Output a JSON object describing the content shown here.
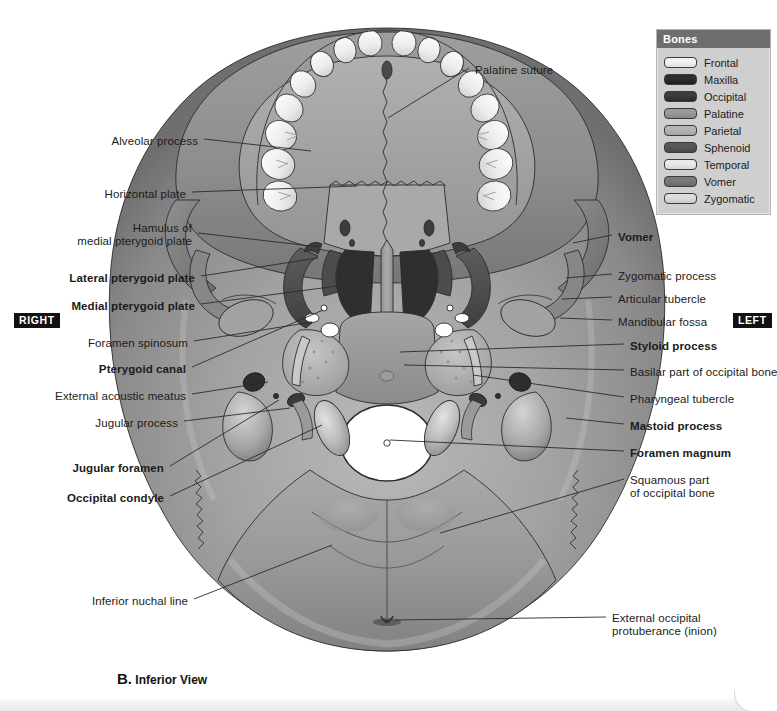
{
  "figure": {
    "caption_letter": "B.",
    "caption_text": "Inferior View"
  },
  "side_markers": {
    "right": "RIGHT",
    "left": "LEFT"
  },
  "legend": {
    "title": "Bones",
    "items": [
      {
        "label": "Frontal",
        "color": "#f2f2f2"
      },
      {
        "label": "Maxilla",
        "color": "#2e2e2e"
      },
      {
        "label": "Occipital",
        "color": "#3d3d3d"
      },
      {
        "label": "Palatine",
        "color": "#9a9a9a"
      },
      {
        "label": "Parietal",
        "color": "#b5b5b5"
      },
      {
        "label": "Sphenoid",
        "color": "#585858"
      },
      {
        "label": "Temporal",
        "color": "#eaeaea"
      },
      {
        "label": "Vomer",
        "color": "#7a7a7a"
      },
      {
        "label": "Zygomatic",
        "color": "#dcdcdc"
      }
    ]
  },
  "labels_left": [
    {
      "name": "alveolar-process",
      "text": "Alveolar process",
      "bold": false,
      "x": 198,
      "y": 135,
      "lx": 204,
      "ly": 139,
      "tx": 311,
      "ty": 151
    },
    {
      "name": "horizontal-plate",
      "text": "Horizontal plate",
      "bold": false,
      "x": 186,
      "y": 188,
      "lx": 192,
      "ly": 192,
      "tx": 357,
      "ty": 186
    },
    {
      "name": "hamulus-medial-pterygoid",
      "text": "Hamulus of\nmedial pterygoid plate",
      "bold": false,
      "x": 192,
      "y": 222,
      "lx": 198,
      "ly": 233,
      "tx": 320,
      "ty": 247
    },
    {
      "name": "lateral-pterygoid-plate",
      "text": "Lateral pterygoid plate",
      "bold": true,
      "x": 195,
      "y": 272,
      "lx": 201,
      "ly": 276,
      "tx": 318,
      "ty": 258
    },
    {
      "name": "medial-pterygoid-plate",
      "text": "Medial pterygoid plate",
      "bold": true,
      "x": 195,
      "y": 300,
      "lx": 201,
      "ly": 304,
      "tx": 345,
      "ty": 285
    },
    {
      "name": "foramen-spinosum",
      "text": "Foramen spinosum",
      "bold": false,
      "x": 188,
      "y": 337,
      "lx": 194,
      "ly": 341,
      "tx": 312,
      "ty": 322
    },
    {
      "name": "pterygoid-canal",
      "text": "Pterygoid canal",
      "bold": true,
      "x": 186,
      "y": 363,
      "lx": 192,
      "ly": 367,
      "tx": 323,
      "ty": 310
    },
    {
      "name": "external-acoustic-meatus",
      "text": "External acoustic meatus",
      "bold": false,
      "x": 186,
      "y": 390,
      "lx": 192,
      "ly": 394,
      "tx": 268,
      "ty": 382
    },
    {
      "name": "jugular-process",
      "text": "Jugular process",
      "bold": false,
      "x": 178,
      "y": 417,
      "lx": 184,
      "ly": 421,
      "tx": 290,
      "ty": 408
    },
    {
      "name": "jugular-foramen",
      "text": "Jugular foramen",
      "bold": true,
      "x": 164,
      "y": 462,
      "lx": 170,
      "ly": 466,
      "tx": 279,
      "ty": 400
    },
    {
      "name": "occipital-condyle",
      "text": "Occipital condyle",
      "bold": true,
      "x": 164,
      "y": 492,
      "lx": 170,
      "ly": 496,
      "tx": 322,
      "ty": 425
    },
    {
      "name": "inferior-nuchal-line",
      "text": "Inferior nuchal line",
      "bold": false,
      "x": 188,
      "y": 595,
      "lx": 194,
      "ly": 599,
      "tx": 332,
      "ty": 545
    }
  ],
  "labels_right": [
    {
      "name": "palatine-suture",
      "text": "Palatine suture",
      "bold": false,
      "x": 475,
      "y": 64,
      "lx": 469,
      "ly": 68,
      "tx": 388,
      "ty": 118
    },
    {
      "name": "vomer",
      "text": "Vomer",
      "bold": true,
      "x": 618,
      "y": 231,
      "lx": 612,
      "ly": 235,
      "tx": 573,
      "ty": 243
    },
    {
      "name": "zygomatic-process",
      "text": "Zygomatic process",
      "bold": false,
      "x": 618,
      "y": 270,
      "lx": 612,
      "ly": 274,
      "tx": 566,
      "ty": 278
    },
    {
      "name": "articular-tubercle",
      "text": "Articular tubercle",
      "bold": false,
      "x": 618,
      "y": 293,
      "lx": 612,
      "ly": 297,
      "tx": 562,
      "ty": 299
    },
    {
      "name": "mandibular-fossa",
      "text": "Mandibular fossa",
      "bold": false,
      "x": 618,
      "y": 316,
      "lx": 612,
      "ly": 320,
      "tx": 560,
      "ty": 318
    },
    {
      "name": "styloid-process",
      "text": "Styloid process",
      "bold": true,
      "x": 630,
      "y": 340,
      "lx": 624,
      "ly": 344,
      "tx": 400,
      "ty": 352
    },
    {
      "name": "basilar-part-occipital",
      "text": "Basilar part of occipital bone",
      "bold": false,
      "x": 630,
      "y": 366,
      "lx": 624,
      "ly": 370,
      "tx": 404,
      "ty": 365
    },
    {
      "name": "pharyngeal-tubercle",
      "text": "Pharyngeal tubercle",
      "bold": false,
      "x": 630,
      "y": 393,
      "lx": 624,
      "ly": 397,
      "tx": 473,
      "ty": 375
    },
    {
      "name": "mastoid-process",
      "text": "Mastoid process",
      "bold": true,
      "x": 630,
      "y": 420,
      "lx": 624,
      "ly": 424,
      "tx": 566,
      "ty": 418
    },
    {
      "name": "foramen-magnum",
      "text": "Foramen magnum",
      "bold": true,
      "x": 630,
      "y": 447,
      "lx": 624,
      "ly": 451,
      "tx": 390,
      "ty": 440
    },
    {
      "name": "squamous-part-occipital",
      "text": "Squamous part\nof occipital bone",
      "bold": false,
      "x": 630,
      "y": 474,
      "lx": 624,
      "ly": 479,
      "tx": 440,
      "ty": 533
    },
    {
      "name": "external-occipital-prot",
      "text": "External occipital\nprotuberance (inion)",
      "bold": false,
      "x": 612,
      "y": 612,
      "lx": 606,
      "ly": 617,
      "tx": 396,
      "ty": 620
    }
  ]
}
